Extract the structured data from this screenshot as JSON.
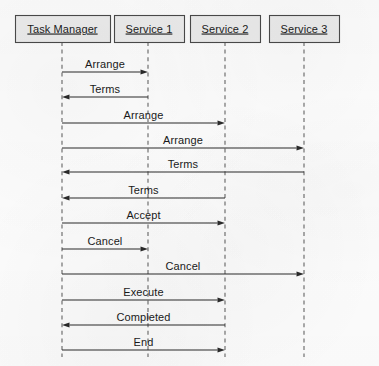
{
  "diagram": {
    "type": "uml-sequence-diagram",
    "width": 379,
    "height": 366,
    "colors": {
      "background": "#fdfdfd",
      "box_fill": "#ececec",
      "box_border": "#4a4a4a",
      "lifeline": "#6d6d6d",
      "arrow": "#2a2a2a",
      "text": "#1a1a1a"
    },
    "participants": [
      {
        "id": "tm",
        "label": "Task Manager",
        "x": 62,
        "box_x": 15,
        "box_y": 15,
        "box_w": 95,
        "box_h": 27
      },
      {
        "id": "s1",
        "label": "Service 1",
        "x": 148,
        "box_x": 114,
        "box_y": 15,
        "box_w": 70,
        "box_h": 27
      },
      {
        "id": "s2",
        "label": "Service 2",
        "x": 225,
        "box_x": 190,
        "box_y": 15,
        "box_w": 70,
        "box_h": 27
      },
      {
        "id": "s3",
        "label": "Service 3",
        "x": 304,
        "box_x": 269,
        "box_y": 15,
        "box_w": 70,
        "box_h": 27
      }
    ],
    "lifeline": {
      "top": 42,
      "bottom": 357
    },
    "messages": [
      {
        "index": 1,
        "label": "Arrange",
        "from": "tm",
        "to": "s1",
        "direction": "right",
        "y": 72
      },
      {
        "index": 2,
        "label": "Terms",
        "from": "s1",
        "to": "tm",
        "direction": "left",
        "y": 97
      },
      {
        "index": 3,
        "label": "Arrange",
        "from": "tm",
        "to": "s2",
        "direction": "right",
        "y": 123
      },
      {
        "index": 4,
        "label": "Arrange",
        "from": "tm",
        "to": "s3",
        "direction": "right",
        "y": 148
      },
      {
        "index": 5,
        "label": "Terms",
        "from": "s3",
        "to": "tm",
        "direction": "left",
        "y": 172
      },
      {
        "index": 6,
        "label": "Terms",
        "from": "s2",
        "to": "tm",
        "direction": "left",
        "y": 198
      },
      {
        "index": 7,
        "label": "Accept",
        "from": "tm",
        "to": "s2",
        "direction": "right",
        "y": 223
      },
      {
        "index": 8,
        "label": "Cancel",
        "from": "tm",
        "to": "s1",
        "direction": "right",
        "y": 249
      },
      {
        "index": 9,
        "label": "Cancel",
        "from": "tm",
        "to": "s3",
        "direction": "right",
        "y": 274
      },
      {
        "index": 10,
        "label": "Execute",
        "from": "tm",
        "to": "s2",
        "direction": "right",
        "y": 300
      },
      {
        "index": 11,
        "label": "Completed",
        "from": "s2",
        "to": "tm",
        "direction": "left",
        "y": 325
      },
      {
        "index": 12,
        "label": "End",
        "from": "tm",
        "to": "s2",
        "direction": "right",
        "y": 350
      }
    ]
  }
}
